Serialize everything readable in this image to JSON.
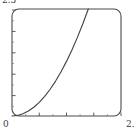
{
  "chart_data": {
    "type": "line",
    "title": "",
    "xlabel": "",
    "ylabel": "",
    "xlim": [
      0,
      2.0
    ],
    "ylim": [
      0,
      2.5
    ],
    "grid": false,
    "legend": null,
    "tick_labels": {
      "y_max": "2.5",
      "y_min": "0",
      "x_max": "2."
    },
    "x_ticks": [
      0.25,
      0.5,
      0.75,
      1.0,
      1.25,
      1.5,
      1.75,
      2.0
    ],
    "y_ticks": [
      0.5,
      1.0,
      1.5,
      2.0,
      2.5
    ],
    "series": [
      {
        "name": "curve",
        "color": "#454545",
        "x": [
          0.0,
          0.1,
          0.2,
          0.3,
          0.4,
          0.5,
          0.6,
          0.7,
          0.8,
          0.9,
          1.0,
          1.1,
          1.2,
          1.3,
          1.4
        ],
        "y": [
          0.0,
          0.013,
          0.051,
          0.115,
          0.204,
          0.319,
          0.459,
          0.625,
          0.816,
          1.033,
          1.276,
          1.543,
          1.837,
          2.156,
          2.5
        ]
      }
    ],
    "annotations": [
      "curve rises convexly from origin and exits top of frame near x = 1.4"
    ]
  },
  "frame": {
    "border_color": "#4a4a4a",
    "background": "#ffffff",
    "tick_color": "#4a4a4a",
    "rounded_corners": true
  }
}
